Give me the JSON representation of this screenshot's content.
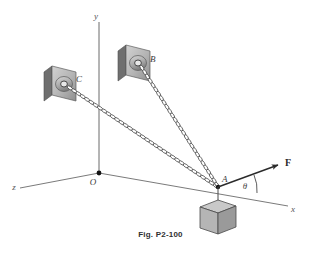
{
  "figure": {
    "caption": "Fig. P2-100",
    "background_color": "#ffffff",
    "line_color": "#555555",
    "ink_color": "#2b2b2b"
  },
  "axes": {
    "y_label": "y",
    "x_label": "x",
    "z_label": "z",
    "origin_label": "O"
  },
  "points": {
    "a_label": "A",
    "b_label": "B",
    "c_label": "C"
  },
  "vector": {
    "force_label": "F",
    "angle_label": "θ"
  },
  "elements": {
    "chain_ab": "chain-cable-a-to-b",
    "chain_ac": "chain-cable-a-to-c",
    "block": "suspended-block",
    "plate_b": "wall-anchor-plate-b",
    "plate_c": "wall-anchor-plate-c"
  },
  "colors": {
    "plate_face": "#bdbdbd",
    "plate_edge": "#8a8a8a",
    "plate_side": "#6f6f6f",
    "block_top": "#c9c9c9",
    "block_front": "#b5b5b5",
    "block_side": "#9a9a9a",
    "chain": "#3c3c3c",
    "axis": "#6b6b6b"
  }
}
